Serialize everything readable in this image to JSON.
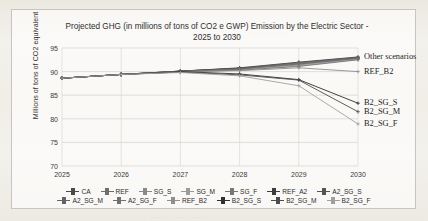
{
  "chart_data": {
    "type": "line",
    "title": "Projected GHG (in millions of tons of CO2 e GWP) Emission by the Electric Sector - 2025 to 2030",
    "title_line1": "Projected GHG (in millions of tons of CO2 e GWP) Emission by the Electric",
    "title_line2": "Sector - 2025 to 2030",
    "xlabel": "",
    "ylabel": "Millions of tons of CO2 equivalent",
    "categories": [
      "2025",
      "2026",
      "2027",
      "2028",
      "2029",
      "2030"
    ],
    "x": [
      2025,
      2026,
      2027,
      2028,
      2029,
      2030
    ],
    "ylim": [
      70,
      95
    ],
    "yticks": [
      70,
      75,
      80,
      85,
      90,
      95
    ],
    "grid": true,
    "legend_position": "bottom",
    "series": [
      {
        "name": "CA",
        "values": [
          88.6,
          89.4,
          90.1,
          90.7,
          91.6,
          92.9
        ],
        "color": "#4a4a4a"
      },
      {
        "name": "REF",
        "values": [
          88.6,
          89.4,
          90.1,
          90.6,
          91.5,
          92.8
        ],
        "color": "#6e6e6e"
      },
      {
        "name": "SG_S",
        "values": [
          88.6,
          89.4,
          90.0,
          90.5,
          91.4,
          92.7
        ],
        "color": "#8a8a8a"
      },
      {
        "name": "SG_M",
        "values": [
          88.6,
          89.4,
          90.0,
          90.4,
          91.2,
          92.6
        ],
        "color": "#9b9b9b"
      },
      {
        "name": "SG_F",
        "values": [
          88.6,
          89.4,
          89.9,
          90.3,
          91.1,
          92.5
        ],
        "color": "#777777"
      },
      {
        "name": "REF_A2",
        "values": [
          88.6,
          89.4,
          90.1,
          90.8,
          92.0,
          93.1
        ],
        "color": "#3d3d3d"
      },
      {
        "name": "A2_SG_S",
        "values": [
          88.6,
          89.4,
          90.1,
          90.7,
          91.9,
          93.0
        ],
        "color": "#555555"
      },
      {
        "name": "A2_SG_M",
        "values": [
          88.6,
          89.4,
          90.0,
          90.6,
          91.8,
          92.9
        ],
        "color": "#636363"
      },
      {
        "name": "A2_SG_F",
        "values": [
          88.6,
          89.4,
          90.0,
          90.5,
          91.7,
          92.8
        ],
        "color": "#707070"
      },
      {
        "name": "REF_B2",
        "values": [
          88.6,
          89.4,
          90.0,
          90.2,
          90.8,
          90.0
        ],
        "color": "#8e8e8e"
      },
      {
        "name": "B2_SG_S",
        "values": [
          88.6,
          89.4,
          90.0,
          89.5,
          88.3,
          83.3
        ],
        "color": "#2f2f2f"
      },
      {
        "name": "B2_SG_M",
        "values": [
          88.6,
          89.4,
          89.9,
          89.3,
          88.2,
          81.5
        ],
        "color": "#4d4d4d"
      },
      {
        "name": "B2_SG_F",
        "values": [
          88.6,
          89.4,
          89.8,
          89.1,
          87.0,
          78.9
        ],
        "color": "#a0a0a0"
      }
    ],
    "annotations": [
      {
        "text": "Other scenarios",
        "value": 93.0,
        "at": "2030"
      },
      {
        "text": "REF_B2",
        "value": 90.0,
        "at": "2030"
      },
      {
        "text": "B2_SG_S",
        "value": 83.3,
        "at": "2030"
      },
      {
        "text": "B2_SG_M",
        "value": 81.5,
        "at": "2030"
      },
      {
        "text": "B2_SG_F",
        "value": 78.9,
        "at": "2030"
      }
    ],
    "legend_rows": [
      [
        "CA",
        "REF",
        "SG_S",
        "SG_M",
        "SG_F",
        "REF_A2",
        "A2_SG_S"
      ],
      [
        "A2_SG_M",
        "A2_SG_F",
        "REF_B2",
        "B2_SG_S",
        "B2_SG_M",
        "B2_SG_F"
      ]
    ]
  },
  "colors": {
    "page_background": "#f3f1ec",
    "plot_background": "#ffffff",
    "gridline": "#d6d3cc",
    "axis_text": "#3a3a3a",
    "title_text": "#2f2f2f"
  }
}
